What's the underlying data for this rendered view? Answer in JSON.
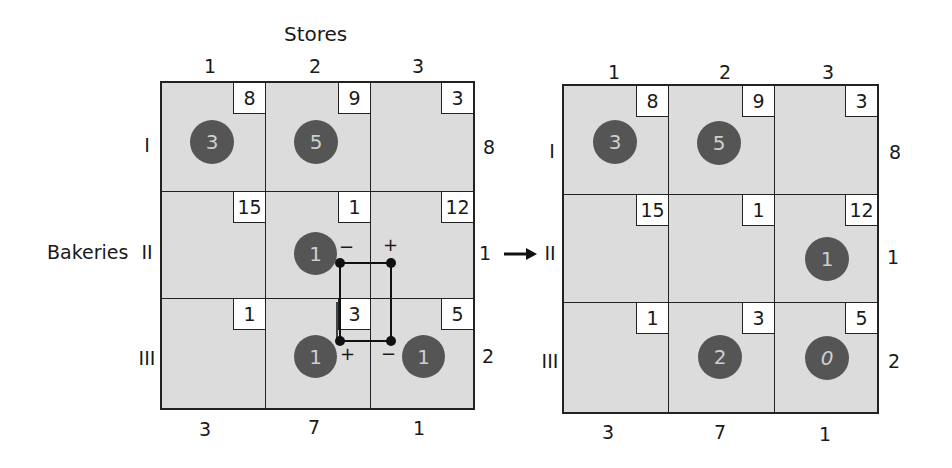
{
  "title": "Stores",
  "row_title": "Bakeries",
  "columns": [
    "1",
    "2",
    "3"
  ],
  "rows": [
    "I",
    "II",
    "III"
  ],
  "costs": [
    [
      "8",
      "9",
      "3"
    ],
    [
      "15",
      "1",
      "12"
    ],
    [
      "1",
      "3",
      "5"
    ]
  ],
  "supply": [
    "8",
    "1",
    "2"
  ],
  "demand": [
    "3",
    "7",
    "1"
  ],
  "left_table": {
    "allocations": [
      {
        "row": 0,
        "col": 0,
        "value": "3"
      },
      {
        "row": 0,
        "col": 1,
        "value": "5"
      },
      {
        "row": 1,
        "col": 1,
        "value": "1"
      },
      {
        "row": 2,
        "col": 1,
        "value": "1"
      },
      {
        "row": 2,
        "col": 2,
        "value": "1"
      }
    ],
    "loop_signs": [
      {
        "cell": "II-2",
        "sign": "−"
      },
      {
        "cell": "II-3",
        "sign": "+"
      },
      {
        "cell": "III-2",
        "sign": "+"
      },
      {
        "cell": "III-3",
        "sign": "−"
      }
    ]
  },
  "right_table": {
    "allocations": [
      {
        "row": 0,
        "col": 0,
        "value": "3"
      },
      {
        "row": 0,
        "col": 1,
        "value": "5"
      },
      {
        "row": 1,
        "col": 2,
        "value": "1"
      },
      {
        "row": 2,
        "col": 1,
        "value": "2"
      },
      {
        "row": 2,
        "col": 2,
        "value": "0"
      }
    ]
  },
  "colors": {
    "cell_fill": "#dcdcdc",
    "allocation_fill": "#555555",
    "allocation_text": "#cfcfcf",
    "line": "#222222"
  }
}
